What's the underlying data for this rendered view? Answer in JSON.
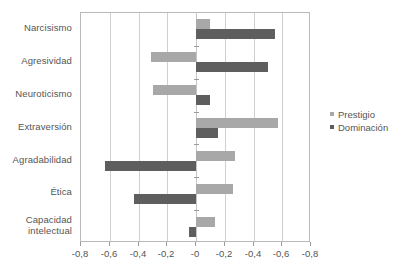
{
  "chart_data": {
    "type": "bar",
    "orientation": "horizontal",
    "title": "",
    "xlabel": "",
    "ylabel": "",
    "grid": true,
    "legend_position": "right",
    "xlim": [
      -0.8,
      0.8
    ],
    "axis_tick_values": [
      -0.8,
      -0.6,
      -0.4,
      -0.2,
      0,
      0.2,
      0.4,
      0.6,
      0.8
    ],
    "axis_tick_labels": [
      "-0,8",
      "-0,6",
      "-0,4",
      "-0,2",
      "-0",
      "-0,2",
      "-0,4",
      "-0,6",
      "-0,8"
    ],
    "categories": [
      "Narcisismo",
      "Agresividad",
      "Neuroticismo",
      "Extraversión",
      "Agradabilidad",
      "Ética",
      "Capacidad intelectual"
    ],
    "category_lines": [
      [
        "Narcisismo"
      ],
      [
        "Agresividad"
      ],
      [
        "Neuroticismo"
      ],
      [
        "Extraversión"
      ],
      [
        "Agradabilidad"
      ],
      [
        "Ética"
      ],
      [
        "Capacidad",
        "intelectual"
      ]
    ],
    "series": [
      {
        "name": "Prestigio",
        "color": "#a8a8a8",
        "values": [
          0.1,
          -0.31,
          -0.3,
          0.57,
          0.27,
          0.26,
          0.13
        ]
      },
      {
        "name": "Dominación",
        "color": "#5e5e5e",
        "values": [
          0.55,
          0.5,
          0.1,
          0.15,
          -0.63,
          -0.43,
          -0.05
        ]
      }
    ]
  },
  "legend": {
    "items": [
      {
        "label": "Prestigio",
        "key": "prestigio"
      },
      {
        "label": "Dominación",
        "key": "dominacion"
      }
    ]
  }
}
